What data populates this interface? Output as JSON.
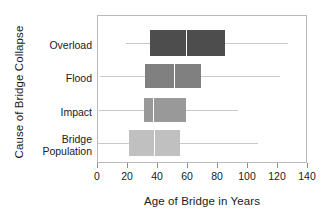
{
  "chart_data": {
    "type": "box",
    "title": "",
    "xlabel": "Age of Bridge in Years",
    "ylabel": "Cause of Bridge Collapse",
    "xlim": [
      0,
      140
    ],
    "xticks": [
      0,
      20,
      40,
      60,
      80,
      100,
      120,
      140
    ],
    "xticklabels": [
      "0",
      "20",
      "40",
      "60",
      "80",
      "100",
      "120",
      "140"
    ],
    "grid": false,
    "legend": false,
    "orientation": "horizontal",
    "categories": [
      "Overload",
      "Flood",
      "Impact",
      "Bridge Population"
    ],
    "boxes": [
      {
        "category": "Overload",
        "whisker_low": 19,
        "q1": 35,
        "median": 59,
        "q3": 85,
        "whisker_high": 127,
        "color": "#4d4d4d"
      },
      {
        "category": "Flood",
        "whisker_low": 2,
        "q1": 32,
        "median": 51,
        "q3": 69,
        "whisker_high": 122,
        "color": "#808080"
      },
      {
        "category": "Impact",
        "whisker_low": 1,
        "q1": 31,
        "median": 37,
        "q3": 59,
        "whisker_high": 94,
        "color": "#999999"
      },
      {
        "category": "Bridge Population",
        "whisker_low": 0,
        "q1": 21,
        "median": 38,
        "q3": 55,
        "whisker_high": 107,
        "color": "#c0c0c0"
      }
    ]
  },
  "axis": {
    "x_title": "Age of Bridge in Years",
    "y_title": "Cause of Bridge Collapse",
    "x_tick_labels": [
      "0",
      "20",
      "40",
      "60",
      "80",
      "100",
      "120",
      "140"
    ],
    "y_category_labels": [
      "Overload",
      "Flood",
      "Impact",
      "Bridge",
      "Population"
    ]
  },
  "colors": {
    "frame": "#b9b9b9",
    "whisker": "#c9c9c9",
    "median": "#ffffff",
    "text": "#1a1a1a",
    "background": "#ffffff"
  }
}
